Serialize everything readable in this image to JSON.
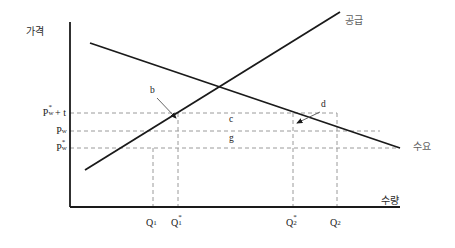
{
  "figure": {
    "title_visible": false,
    "axes": {
      "y_axis_title": "가격",
      "x_axis_title": "수량",
      "origin_px": [
        70,
        207
      ],
      "y_top_px": 22,
      "x_right_px": 400
    },
    "curves": [
      {
        "name": "supply",
        "label": "공급",
        "label_color": "#6b6b6b",
        "from_px": [
          85,
          170
        ],
        "to_px": [
          340,
          12
        ]
      },
      {
        "name": "demand",
        "label": "수요",
        "label_color": "#6b6b6b",
        "from_px": [
          90,
          43
        ],
        "to_px": [
          400,
          148
        ]
      }
    ],
    "price_ticks": [
      {
        "id": "p-world-plus-tariff",
        "base": "P",
        "sub": "w",
        "sup": "*",
        "suffix": " + t",
        "y_px": 113
      },
      {
        "id": "p-world-domestic",
        "base": "P",
        "sub": "w",
        "sup": "",
        "suffix": "",
        "y_px": 131
      },
      {
        "id": "p-world",
        "base": "P",
        "sub": "w",
        "sup": "*",
        "suffix": "",
        "y_px": 148
      }
    ],
    "quantity_ticks": [
      {
        "id": "q1",
        "base": "Q",
        "sub": "1",
        "sup": "",
        "x_px": 153
      },
      {
        "id": "q1-star",
        "base": "Q",
        "sub": "1",
        "sup": "*",
        "x_px": 178
      },
      {
        "id": "q2-star",
        "base": "Q",
        "sub": "2",
        "sup": "*",
        "x_px": 293
      },
      {
        "id": "q2",
        "base": "Q",
        "sub": "2",
        "sup": "",
        "x_px": 337
      }
    ],
    "area_letters": [
      {
        "id": "area-c",
        "text": "c",
        "x_px": 229,
        "y_px": 119
      },
      {
        "id": "area-g",
        "text": "g",
        "x_px": 229,
        "y_px": 138
      }
    ],
    "callouts": [
      {
        "id": "callout-b",
        "text": "b",
        "label_px": [
          152,
          90
        ],
        "from_px": [
          157,
          98
        ],
        "to_px": [
          176,
          119
        ]
      },
      {
        "id": "callout-d",
        "text": "d",
        "label_px": [
          322,
          104
        ],
        "from_px": [
          320,
          112
        ],
        "to_px": [
          296,
          124
        ]
      }
    ],
    "colors": {
      "line": "#1a1a1a",
      "dashed": "#9a9a9a",
      "text": "#1a1a1a",
      "muted_text": "#6b6b6b",
      "background": "#ffffff"
    }
  }
}
